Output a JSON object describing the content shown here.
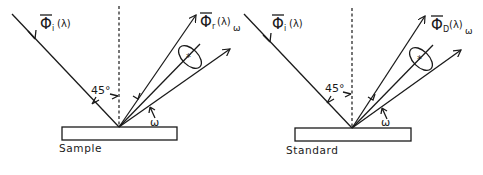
{
  "figure": {
    "panels": [
      {
        "id": "sample",
        "caption": "Sample",
        "incident_symbol": "Φ",
        "incident_subscript": "i",
        "incident_arg": "(λ)",
        "reflected_symbol": "Φ",
        "reflected_subscript": "r",
        "reflected_arg": "(λ)",
        "reflected_solid_angle_subscript": "ω",
        "angle_label": "45°",
        "solid_angle_label": "ω"
      },
      {
        "id": "standard",
        "caption": "Standard",
        "incident_symbol": "Φ",
        "incident_subscript": "i",
        "incident_arg": "(λ)",
        "reflected_symbol": "Φ",
        "reflected_subscript": "D",
        "reflected_arg": "(λ)",
        "reflected_solid_angle_subscript": "ω",
        "angle_label": "45°",
        "solid_angle_label": "ω"
      }
    ],
    "colors": {
      "ink": "#1a1a1a",
      "background": "#ffffff"
    }
  }
}
